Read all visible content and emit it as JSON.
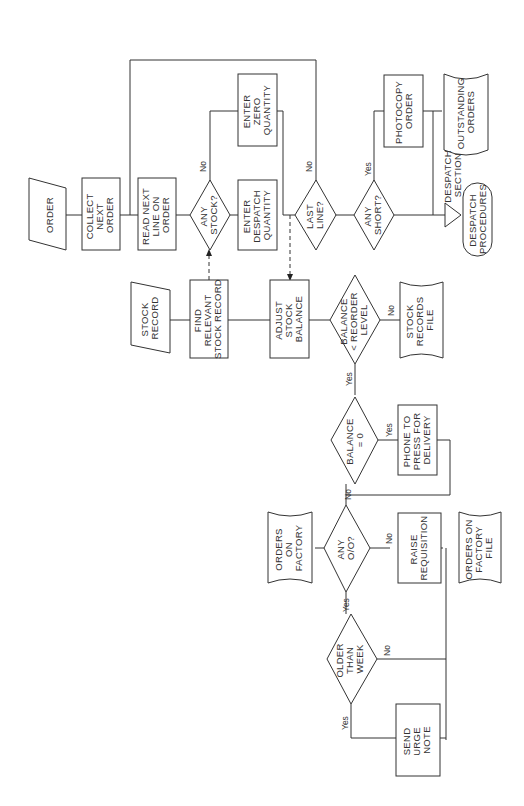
{
  "diagram": {
    "orientation": "rotated 90 degrees counter-clockwise; text reads bottom-to-top",
    "nodes": {
      "order": {
        "type": "manual-input",
        "lines": [
          "ORDER"
        ]
      },
      "collect_next_order": {
        "type": "process",
        "lines": [
          "COLLECT",
          "NEXT",
          "ORDER"
        ]
      },
      "read_next_line": {
        "type": "process",
        "lines": [
          "READ NEXT",
          "LINE ON",
          "ORDER"
        ]
      },
      "any_stock": {
        "type": "decision",
        "lines": [
          "ANY",
          "STOCK?"
        ]
      },
      "enter_zero_quantity": {
        "type": "process",
        "lines": [
          "ENTER",
          "ZERO",
          "QUANTITY"
        ]
      },
      "enter_despatch_quantity": {
        "type": "process",
        "lines": [
          "ENTER",
          "DESPATCH",
          "QUANTITY"
        ]
      },
      "last_line": {
        "type": "decision",
        "lines": [
          "LAST",
          "LINE?"
        ]
      },
      "any_short": {
        "type": "decision",
        "lines": [
          "ANY",
          "SHORT?"
        ]
      },
      "photocopy_order": {
        "type": "process",
        "lines": [
          "PHOTOCOPY",
          "ORDER"
        ]
      },
      "outstanding_orders": {
        "type": "file",
        "lines": [
          "OUTSTANDING",
          "ORDERS"
        ]
      },
      "despatch_section": {
        "type": "offpage",
        "lines": [
          "DESPATCH",
          "SECTION"
        ]
      },
      "despatch_procedures": {
        "type": "terminator",
        "lines": [
          "DESPATCH",
          "PROCEDURES"
        ]
      },
      "stock_record": {
        "type": "manual-input",
        "lines": [
          "STOCK",
          "RECORD"
        ]
      },
      "find_relevant_stock_record": {
        "type": "process",
        "lines": [
          "FIND",
          "RELEVANT",
          "STOCK RECORD"
        ]
      },
      "adjust_stock_balance": {
        "type": "process",
        "lines": [
          "ADJUST",
          "STOCK",
          "BALANCE"
        ]
      },
      "balance_lt_reorder": {
        "type": "decision",
        "lines": [
          "BALANCE",
          "< REORDER",
          "LEVEL"
        ]
      },
      "stock_records_file": {
        "type": "file",
        "lines": [
          "STOCK",
          "RECORDS",
          "FILE"
        ]
      },
      "balance_eq_0": {
        "type": "decision",
        "lines": [
          "BALANCE",
          "= 0"
        ]
      },
      "phone_to_press": {
        "type": "process",
        "lines": [
          "PHONE TO",
          "PRESS FOR",
          "DELIVERY"
        ]
      },
      "orders_on_factory": {
        "type": "file",
        "lines": [
          "ORDERS",
          "ON",
          "FACTORY"
        ]
      },
      "any_oo": {
        "type": "decision",
        "lines": [
          "ANY",
          "O/O?"
        ]
      },
      "raise_requisition": {
        "type": "process",
        "lines": [
          "RAISE",
          "REQUISITION"
        ]
      },
      "orders_on_factory_file": {
        "type": "file",
        "lines": [
          "ORDERS ON",
          "FACTORY",
          "FILE"
        ]
      },
      "older_than_week": {
        "type": "decision",
        "lines": [
          "OLDER",
          "THAN",
          "WEEK"
        ]
      },
      "send_urge_note": {
        "type": "process",
        "lines": [
          "SEND",
          "URGE",
          "NOTE"
        ]
      }
    },
    "branch_labels": {
      "any_stock_no": "No",
      "last_line_no": "No",
      "any_short_yes": "Yes",
      "balance_lt_reorder_no": "No",
      "balance_lt_reorder_yes": "Yes",
      "balance_eq_0_yes": "Yes",
      "balance_eq_0_no": "No",
      "any_oo_no": "No",
      "any_oo_yes": "Yes",
      "older_than_week_no": "No",
      "older_than_week_yes": "Yes"
    }
  }
}
